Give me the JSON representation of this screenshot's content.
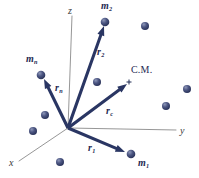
{
  "figure": {
    "name": "center-of-mass-vector-diagram",
    "background_color": "#ffffff",
    "vector_color": "#2a3663",
    "axis_color": "#8a8a8a",
    "particle_color": "#47527f",
    "label_color": "#1e2a52",
    "width": 199,
    "height": 178
  },
  "axes": [
    {
      "id": "z",
      "label": "z",
      "label_x": 68,
      "label_y": 6,
      "x1": 72,
      "y1": 16,
      "x2": 68,
      "y2": 128
    },
    {
      "id": "y",
      "label": "y",
      "label_x": 180,
      "label_y": 126,
      "x1": 68,
      "y1": 128,
      "x2": 176,
      "y2": 130
    },
    {
      "id": "x",
      "label": "x",
      "label_x": 9,
      "label_y": 158,
      "x1": 68,
      "y1": 128,
      "x2": 19,
      "y2": 161
    }
  ],
  "origin": {
    "x": 68,
    "y": 128
  },
  "vectors": [
    {
      "id": "r2",
      "label": "r",
      "subscript": "2",
      "label_x": 97,
      "label_y": 47,
      "tip_x": 104,
      "tip_y": 26,
      "mass_label": "m",
      "mass_subscript": "2",
      "mass_label_x": 101,
      "mass_label_y": 1,
      "particle_x": 105,
      "particle_y": 22,
      "particle_r": 4.3
    },
    {
      "id": "rn",
      "label": "r",
      "subscript": "n",
      "label_x": 55,
      "label_y": 83,
      "tip_x": 44,
      "tip_y": 79,
      "mass_label": "m",
      "mass_subscript": "n",
      "mass_label_x": 26,
      "mass_label_y": 54,
      "particle_x": 41,
      "particle_y": 75,
      "particle_r": 4.3
    },
    {
      "id": "rc",
      "label": "r",
      "subscript": "c",
      "label_x": 106,
      "label_y": 106,
      "tip_x": 127,
      "tip_y": 84,
      "mass_label": "C.M.",
      "mass_subscript": "",
      "mass_label_x": 131,
      "mass_label_y": 65,
      "particle_x": 129,
      "particle_y": 82,
      "particle_r": 0
    },
    {
      "id": "r1",
      "label": "r",
      "subscript": "1",
      "label_x": 88,
      "label_y": 143,
      "tip_x": 125,
      "tip_y": 152,
      "mass_label": "m",
      "mass_subscript": "1",
      "mass_label_x": 138,
      "mass_label_y": 158,
      "particle_x": 131,
      "particle_y": 154,
      "particle_r": 4.3
    }
  ],
  "center_of_mass_marker": {
    "x": 129,
    "y": 82,
    "size": 5
  },
  "background_particles": [
    {
      "x": 145,
      "y": 26,
      "r": 4.0
    },
    {
      "x": 187,
      "y": 89,
      "r": 4.0
    },
    {
      "x": 166,
      "y": 106,
      "r": 4.0
    },
    {
      "x": 97,
      "y": 82,
      "r": 4.0
    },
    {
      "x": 45,
      "y": 115,
      "r": 4.0
    },
    {
      "x": 33,
      "y": 131,
      "r": 4.0
    },
    {
      "x": 60,
      "y": 162,
      "r": 4.0
    }
  ]
}
